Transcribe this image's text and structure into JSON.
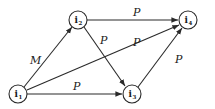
{
  "diagram": {
    "type": "directed-graph",
    "nodes": [
      {
        "id": "i1",
        "base": "i",
        "sub": "1",
        "x": 18,
        "y": 94
      },
      {
        "id": "i2",
        "base": "i",
        "sub": "2",
        "x": 78,
        "y": 20
      },
      {
        "id": "i3",
        "base": "i",
        "sub": "3",
        "x": 132,
        "y": 94
      },
      {
        "id": "i4",
        "base": "i",
        "sub": "4",
        "x": 188,
        "y": 20
      }
    ],
    "edges": [
      {
        "from": "i1",
        "to": "i2",
        "label": "M"
      },
      {
        "from": "i1",
        "to": "i3",
        "label": "P"
      },
      {
        "from": "i1",
        "to": "i4",
        "label": "P"
      },
      {
        "from": "i2",
        "to": "i3",
        "label": "P"
      },
      {
        "from": "i2",
        "to": "i4",
        "label": "P"
      },
      {
        "from": "i3",
        "to": "i4",
        "label": "P"
      }
    ],
    "colors": {
      "stroke": "#2a2a2a",
      "background": "#ffffff"
    }
  }
}
